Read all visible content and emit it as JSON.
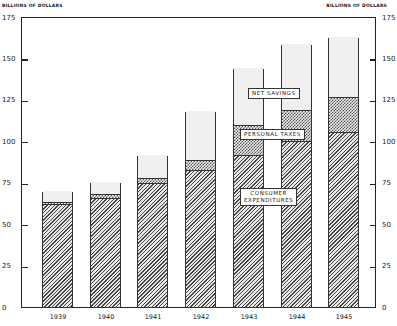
{
  "chart_data": {
    "type": "bar",
    "stacked": true,
    "title": "",
    "xlabel": "",
    "ylabel": "BILLIONS OF DOLLARS",
    "ylabel_right": "BILLIONS OF DOLLARS",
    "ylim": [
      0,
      175
    ],
    "yticks": [
      0,
      25,
      50,
      75,
      100,
      125,
      150,
      175
    ],
    "grid": false,
    "categories": [
      "1939",
      "1940",
      "1941",
      "1942",
      "1943",
      "1944",
      "1945"
    ],
    "series": [
      {
        "name": "CONSUMER EXPENDITURES",
        "pattern": "diagonal-hatch",
        "values": [
          61.7,
          65,
          74,
          82,
          91,
          99.5,
          105
        ]
      },
      {
        "name": "PERSONAL TAXES",
        "pattern": "crosshatch",
        "values": [
          1.8,
          3,
          4,
          6.5,
          19,
          19.5,
          22
        ]
      },
      {
        "name": "NET SAVINGS",
        "pattern": "light-stipple",
        "values": [
          6.5,
          7.5,
          14,
          29.5,
          34,
          40,
          36
        ]
      }
    ],
    "totals": [
      70,
      75.5,
      92,
      118,
      144,
      159,
      163
    ],
    "annotations": [
      "NET SAVINGS",
      "PERSONAL TAXES",
      "CONSUMER EXPENDITURES"
    ]
  },
  "axis": {
    "left_unit": "BILLIONS OF DOLLARS",
    "right_unit": "BILLIONS OF DOLLARS",
    "ticks": [
      "0",
      "25",
      "50",
      "75",
      "100",
      "125",
      "150",
      "175"
    ]
  },
  "labels": {
    "net_savings": "NET SAVINGS",
    "personal_taxes": "PERSONAL TAXES",
    "consumer_1": "CONSUMER",
    "consumer_2": "EXPENDITURES"
  }
}
